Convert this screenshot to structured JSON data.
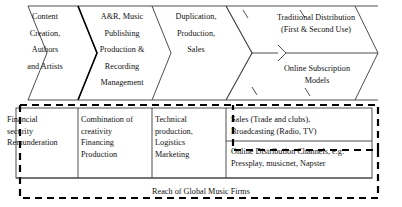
{
  "diagram": {
    "colors": {
      "line": "#3a3a3a",
      "line_bold": "#000000",
      "text": "#111111",
      "background": "#ffffff",
      "dashed_boundary": "#000000"
    },
    "value_chain_stages": [
      {
        "id": "content-creation",
        "label": "Content\nCreation,\nAuthors\nand Artists"
      },
      {
        "id": "ar-publishing",
        "label": "A&R, Music\nPublishing\nProduction &\nRecording\nManagement"
      },
      {
        "id": "duplication",
        "label": "Duplication,\nProduction,\nSales"
      },
      {
        "id": "traditional-distribution",
        "label": "Traditional Distribution\n(First & Second Use)"
      },
      {
        "id": "online-subscription",
        "label": "Online Subscription\nModels"
      }
    ],
    "activity_boxes": [
      {
        "id": "financial-security",
        "label": "Financial\nsecurity\nRemunderation"
      },
      {
        "id": "creativity-financing",
        "label": "Combination of\ncreativity\nFinancing\nProduction"
      },
      {
        "id": "technical-production",
        "label": "Technical\nproduction,\nLogistics\nMarketing"
      },
      {
        "id": "sales-broadcasting",
        "label": "Sales (Trade and clubs),\nBroadcasting (Radio, TV)"
      },
      {
        "id": "online-distribution-channels",
        "label": "Online Distribution Channels, e.g.\nPressplay, musicnet, Napster"
      }
    ],
    "footer": {
      "label": "Reach of Global Music Firms"
    }
  }
}
